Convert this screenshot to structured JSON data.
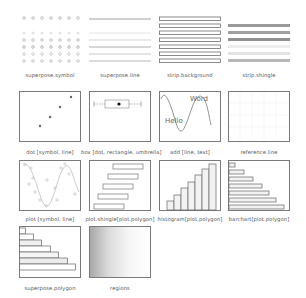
{
  "panels": [
    {
      "id": "superpose-symbol",
      "label": "superpose.symbol"
    },
    {
      "id": "superpose-line",
      "label": "superpose.line"
    },
    {
      "id": "strip-background",
      "label": "strip.background"
    },
    {
      "id": "strip-shingle",
      "label": "strip.shingle"
    },
    {
      "id": "dot",
      "label": "dot [symbol, line]"
    },
    {
      "id": "box",
      "label": "box [dot, rectangle, umbrella]"
    },
    {
      "id": "add",
      "label": "add [line, text]"
    },
    {
      "id": "reference-line",
      "label": "reference.line"
    },
    {
      "id": "plot",
      "label": "plot [symbol, line]"
    },
    {
      "id": "plot-shingle",
      "label": "plot.shingle[plot.polygon]"
    },
    {
      "id": "histogram",
      "label": "histogram[plot.polygon]"
    },
    {
      "id": "barchart",
      "label": "barchart[plot.polygon]"
    },
    {
      "id": "superpose-polygon",
      "label": "superpose.polygon"
    },
    {
      "id": "regions",
      "label": "regions"
    }
  ],
  "add_panel_text": {
    "word": "Word",
    "hello": "Hello"
  },
  "colors": {
    "border": "#7a7a7a",
    "symbol": "#b0b0b0",
    "line": "#8a8a8a",
    "strip_dark": "#9a9a9a",
    "strip_light": "#dcdcdc",
    "bar_fill": "#f2f2f2",
    "regions_start": "#a8a8a8",
    "regions_end": "#ffffff"
  }
}
